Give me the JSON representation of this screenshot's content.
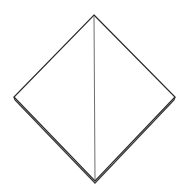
{
  "diagram": {
    "title": "",
    "colors": {
      "background": "#ffffff",
      "outline": "#2a2a2a",
      "crease": "#6e6e6e",
      "back_layer": "#3a3a3a"
    },
    "shape": {
      "top": [
        94,
        15
      ],
      "left": [
        14,
        97
      ],
      "right": [
        175,
        97
      ],
      "bottom": [
        95,
        181
      ]
    },
    "back_layer": {
      "left": [
        15,
        100
      ],
      "right": [
        174,
        100
      ],
      "bottom": [
        95,
        183
      ]
    },
    "crease": {
      "from": [
        94,
        16
      ],
      "to": [
        95,
        180
      ]
    }
  }
}
